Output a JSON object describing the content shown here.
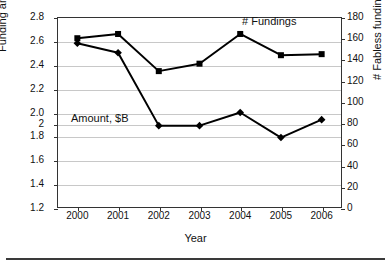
{
  "chart_data": {
    "type": "line",
    "title": "",
    "xlabel": "Year",
    "ylabel": "Funding amount, $B",
    "y2label": "# Fabless funding",
    "categories": [
      "2000",
      "2001",
      "2002",
      "2003",
      "2004",
      "2005",
      "2006"
    ],
    "x": [
      2000,
      2001,
      2002,
      2003,
      2004,
      2005,
      2006
    ],
    "ylim": [
      1.2,
      2.8
    ],
    "y2lim": [
      0,
      180
    ],
    "yticks": [
      "1.2",
      "1.4",
      "1.6",
      "1.8",
      "2",
      "2.0",
      "2.2",
      "2.4",
      "2.6",
      "2.8"
    ],
    "ytick_values": [
      1.2,
      1.4,
      1.6,
      1.8,
      1.9,
      2.0,
      2.2,
      2.4,
      2.6,
      2.8
    ],
    "y2ticks": [
      "0",
      "20",
      "40",
      "60",
      "80",
      "100",
      "120",
      "140",
      "160",
      "180"
    ],
    "y2tick_values": [
      0,
      20,
      40,
      60,
      80,
      100,
      120,
      140,
      160,
      180
    ],
    "grid": true,
    "legend": "inline-annotations",
    "series": [
      {
        "name": "# Fundings",
        "axis": "right",
        "marker": "square",
        "color": "#000000",
        "values": [
          160,
          164,
          129,
          136,
          164,
          144,
          145
        ]
      },
      {
        "name": "Amount, $B",
        "axis": "left",
        "marker": "diamond",
        "color": "#000000",
        "values": [
          2.58,
          2.5,
          1.89,
          1.89,
          2.0,
          1.79,
          1.94
        ]
      }
    ],
    "annotations": [
      {
        "text": "# Fundings",
        "series": "# Fundings"
      },
      {
        "text": "Amount, $B",
        "series": "Amount, $B"
      }
    ]
  }
}
